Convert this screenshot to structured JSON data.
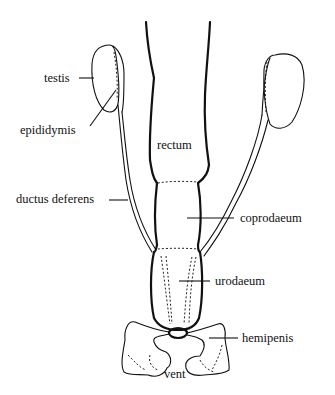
{
  "diagram": {
    "type": "anatomical illustration",
    "labels": {
      "testis": "testis",
      "epididymis": "epididymis",
      "ductus_deferens": "ductus deferens",
      "rectum": "rectum",
      "coprodaeum": "coprodaeum",
      "urodaeum": "urodaeum",
      "hemipenis": "hemipenis",
      "vent": "vent"
    },
    "colors": {
      "line": "#111111",
      "background": "#ffffff"
    }
  }
}
